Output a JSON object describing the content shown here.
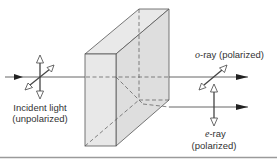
{
  "diagram": {
    "colors": {
      "line": "#3a3a3a",
      "crystal_fill": "#e6e6e6",
      "crystal_fill_side": "#dcdcdc",
      "rule": "#9a9a9a"
    },
    "nodes": [
      {
        "id": "incident",
        "label_line1": "Incident light",
        "label_line2": "(unpolarized)"
      },
      {
        "id": "crystal",
        "label": ""
      },
      {
        "id": "o_ray",
        "symbol": "o",
        "label_suffix": "-ray  (polarized)"
      },
      {
        "id": "e_ray",
        "symbol": "e",
        "label_suffix": "-ray",
        "label_line2": "(polarized)"
      }
    ],
    "edges": [
      {
        "from": "incident",
        "to": "crystal",
        "type": "ray"
      },
      {
        "from": "crystal",
        "to": "o_ray",
        "type": "ray"
      },
      {
        "from": "crystal",
        "to": "e_ray",
        "type": "ray"
      }
    ]
  }
}
